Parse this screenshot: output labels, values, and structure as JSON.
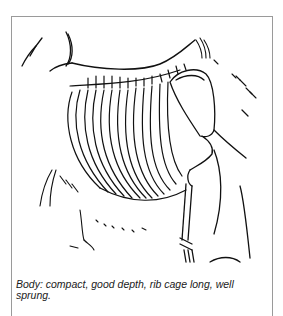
{
  "figure": {
    "caption": "Body: compact, good depth, rib cage long, well sprung.",
    "colors": {
      "line": "#111111",
      "frame": "#9a9a9a",
      "background": "#ffffff"
    }
  }
}
